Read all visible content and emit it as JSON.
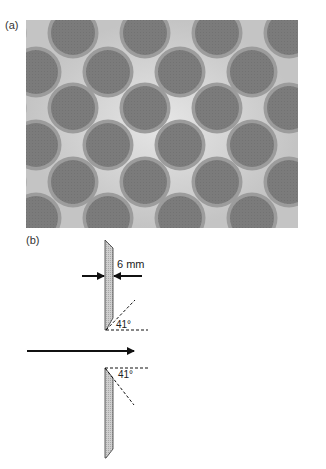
{
  "panels": {
    "a": {
      "label": "(a)",
      "description": "Photograph of hexagonally packed circular perforations (dark discs) with light interstitial gaps",
      "colors": {
        "disc": "#7a7a7a",
        "ring": "#9c9c9c",
        "gap_light": "#dcdcdc",
        "background": "#b9b9b9"
      }
    },
    "b": {
      "label": "(b)",
      "thickness_label": "6 mm",
      "upper_angle_label": "41°",
      "lower_angle_label": "41°",
      "flow_arrow": "flow-direction-arrow",
      "colors": {
        "plate_fill": "#c8c8c8",
        "line": "#111111"
      }
    }
  }
}
